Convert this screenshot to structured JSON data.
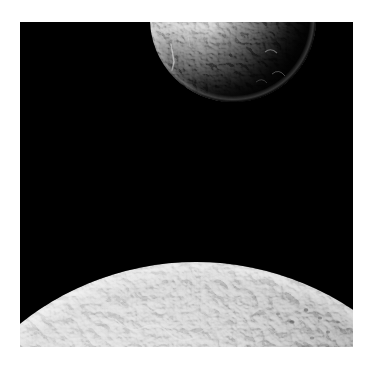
{
  "image": {
    "title": "Two icy moons against black space",
    "medium": "grayscale astronomical photograph",
    "orientation": "portrait",
    "frame": {
      "matte_color": "#ffffff",
      "matte_left": 20,
      "matte_top": 22,
      "content_width": 333,
      "content_height": 325
    },
    "background": {
      "name": "deep-space",
      "color": "#000000",
      "description": "black star-free sky"
    }
  },
  "colors": {
    "space_black": "#000000",
    "matte_white": "#ffffff",
    "limb_highlight": "#f2f2f2",
    "surface_bright": "#cfcfcf",
    "surface_mid": "#9a9a9a",
    "surface_dark": "#4a4a4a",
    "terminator_shadow": "#0a0a0a"
  },
  "objects": [
    {
      "id": "upper-moon",
      "name": "upper-moon",
      "label": "Small moon (upper, partially cropped by frame)",
      "shape": "sphere",
      "center_x": 213,
      "center_y": -3,
      "radius": 83,
      "cropped_edge": "top",
      "illumination": "lit from upper-left, terminator on right",
      "brightest_value": "#d8d8d8",
      "darkest_value": "#0b0b0b",
      "visible_span_x": [
        118,
        278
      ],
      "visible_span_y": [
        0,
        84
      ],
      "features": [
        "heavily cratered terrain",
        "bright crater rims near limb",
        "rough shadowed terminator at right",
        "linear bright streak near left limb"
      ]
    },
    {
      "id": "lower-moon",
      "name": "lower-moon",
      "label": "Large moon limb (lower, filling bottom of frame)",
      "shape": "sphere",
      "center_x": 176,
      "center_y": 522,
      "radius": 282,
      "cropped_edge": "bottom",
      "illumination": "broadly lit, terminator beyond right limb",
      "brightest_value": "#e6e6e6",
      "darkest_value": "#3c3c3c",
      "limb_apex_x": 176,
      "limb_apex_y": 240,
      "limb_left_edge_y": 283,
      "limb_right_edge_y": 308,
      "features": [
        "bright wispy ice cliffs / fracture streaks",
        "dense small craters across terminator side",
        "mottled light and dark patches",
        "sharp illuminated limb against black sky"
      ]
    }
  ],
  "annotations": {
    "object_count": 2,
    "visible_text": "none"
  }
}
